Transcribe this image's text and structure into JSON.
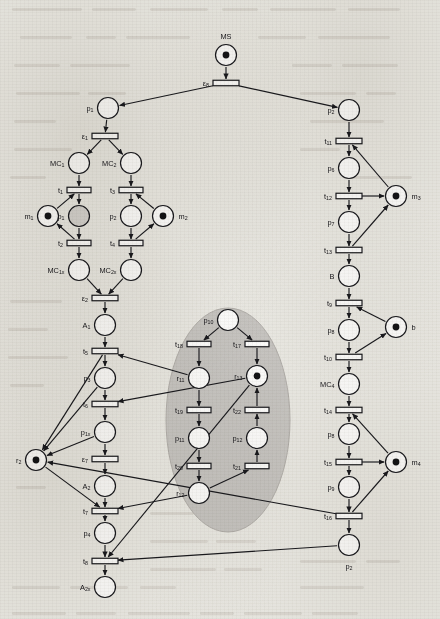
{
  "diagram": {
    "type": "petri-net",
    "title": "MS",
    "background_note": "scanned book page with faint text bleed-through",
    "highlight_region": {
      "name": "shaded-ellipse",
      "color": "#c9c7c4",
      "cx": 228,
      "cy": 420,
      "rx": 62,
      "ry": 112
    }
  },
  "places": [
    {
      "id": "MS",
      "label": "MS",
      "x": 226,
      "y": 55,
      "tokens": 1,
      "label_pos": "above",
      "fill": "#ffffff"
    },
    {
      "id": "p1",
      "label": "p",
      "sub": "1",
      "x": 108,
      "y": 108,
      "tokens": 0,
      "label_pos": "left",
      "fill": "#ffffff"
    },
    {
      "id": "p5",
      "label": "p",
      "sub": "2",
      "x": 349,
      "y": 110,
      "tokens": 0,
      "label_pos": "left",
      "fill": "#ffffff"
    },
    {
      "id": "MC1",
      "label": "MC",
      "sub": "1",
      "x": 79,
      "y": 163,
      "tokens": 0,
      "label_pos": "left",
      "fill": "#ffffff"
    },
    {
      "id": "MC2",
      "label": "MC",
      "sub": "2",
      "x": 131,
      "y": 163,
      "tokens": 0,
      "label_pos": "left",
      "fill": "#ffffff"
    },
    {
      "id": "m1",
      "label": "m",
      "sub": "1",
      "x": 48,
      "y": 216,
      "tokens": 1,
      "label_pos": "left",
      "fill": "#ffffff"
    },
    {
      "id": "pl1",
      "label": "p",
      "sub": "1",
      "x": 79,
      "y": 216,
      "tokens": 0,
      "label_pos": "left",
      "fill": "#d8d6d3"
    },
    {
      "id": "pl2",
      "label": "p",
      "sub": "2",
      "x": 131,
      "y": 216,
      "tokens": 0,
      "label_pos": "left",
      "fill": "#ffffff"
    },
    {
      "id": "m2",
      "label": "m",
      "sub": "2",
      "x": 163,
      "y": 216,
      "tokens": 1,
      "label_pos": "right",
      "fill": "#ffffff"
    },
    {
      "id": "MC1x",
      "label": "MC",
      "sub": "1x",
      "x": 79,
      "y": 270,
      "tokens": 0,
      "label_pos": "left",
      "fill": "#ffffff"
    },
    {
      "id": "MC2x",
      "label": "MC",
      "sub": "2x",
      "x": 131,
      "y": 270,
      "tokens": 0,
      "label_pos": "left",
      "fill": "#ffffff"
    },
    {
      "id": "A1",
      "label": "A",
      "sub": "1",
      "x": 105,
      "y": 325,
      "tokens": 0,
      "label_pos": "left",
      "fill": "#ffffff"
    },
    {
      "id": "p3",
      "label": "p",
      "sub": "3",
      "x": 105,
      "y": 378,
      "tokens": 0,
      "label_pos": "left",
      "fill": "#ffffff"
    },
    {
      "id": "p1x",
      "label": "p",
      "sub": "1x",
      "x": 105,
      "y": 432,
      "tokens": 0,
      "label_pos": "left",
      "fill": "#ffffff"
    },
    {
      "id": "r2",
      "label": "r",
      "sub": "2",
      "x": 36,
      "y": 460,
      "tokens": 1,
      "label_pos": "left",
      "fill": "#ffffff"
    },
    {
      "id": "A2",
      "label": "A",
      "sub": "2",
      "x": 105,
      "y": 486,
      "tokens": 0,
      "label_pos": "left",
      "fill": "#ffffff"
    },
    {
      "id": "p4",
      "label": "p",
      "sub": "4",
      "x": 105,
      "y": 533,
      "tokens": 0,
      "label_pos": "left",
      "fill": "#ffffff"
    },
    {
      "id": "A2x",
      "label": "A",
      "sub": "2x",
      "x": 105,
      "y": 587,
      "tokens": 0,
      "label_pos": "left",
      "fill": "#ffffff"
    },
    {
      "id": "p10",
      "label": "p",
      "sub": "10",
      "x": 228,
      "y": 320,
      "tokens": 0,
      "label_pos": "left",
      "fill": "#ffffff"
    },
    {
      "id": "r11",
      "label": "r",
      "sub": "11",
      "x": 199,
      "y": 378,
      "tokens": 0,
      "label_pos": "left",
      "fill": "#ffffff"
    },
    {
      "id": "r13",
      "label": "r",
      "sub": "13",
      "x": 257,
      "y": 376,
      "tokens": 1,
      "label_pos": "left",
      "fill": "#ffffff"
    },
    {
      "id": "p11",
      "label": "p",
      "sub": "11",
      "x": 199,
      "y": 438,
      "tokens": 0,
      "label_pos": "left",
      "fill": "#ffffff"
    },
    {
      "id": "p12",
      "label": "p",
      "sub": "12",
      "x": 257,
      "y": 438,
      "tokens": 0,
      "label_pos": "left",
      "fill": "#ffffff"
    },
    {
      "id": "r12",
      "label": "r",
      "sub": "12",
      "x": 199,
      "y": 493,
      "tokens": 0,
      "label_pos": "left",
      "fill": "#ffffff"
    },
    {
      "id": "p6",
      "label": "p",
      "sub": "6",
      "x": 349,
      "y": 168,
      "tokens": 0,
      "label_pos": "left",
      "fill": "#ffffff"
    },
    {
      "id": "m3",
      "label": "m",
      "sub": "3",
      "x": 396,
      "y": 196,
      "tokens": 1,
      "label_pos": "right",
      "fill": "#ffffff"
    },
    {
      "id": "p7",
      "label": "p",
      "sub": "7",
      "x": 349,
      "y": 222,
      "tokens": 0,
      "label_pos": "left",
      "fill": "#ffffff"
    },
    {
      "id": "B",
      "label": "B",
      "x": 349,
      "y": 276,
      "tokens": 0,
      "label_pos": "left",
      "fill": "#ffffff"
    },
    {
      "id": "p8",
      "label": "p",
      "sub": "8",
      "x": 349,
      "y": 330,
      "tokens": 0,
      "label_pos": "left",
      "fill": "#ffffff"
    },
    {
      "id": "b",
      "label": "b",
      "x": 396,
      "y": 327,
      "tokens": 1,
      "label_pos": "right",
      "fill": "#ffffff"
    },
    {
      "id": "MC4",
      "label": "MC",
      "sub": "4",
      "x": 349,
      "y": 384,
      "tokens": 0,
      "label_pos": "left",
      "fill": "#ffffff"
    },
    {
      "id": "p8b",
      "label": "p",
      "sub": "8",
      "x": 349,
      "y": 434,
      "tokens": 0,
      "label_pos": "left",
      "fill": "#ffffff"
    },
    {
      "id": "m4",
      "label": "m",
      "sub": "4",
      "x": 396,
      "y": 462,
      "tokens": 1,
      "label_pos": "right",
      "fill": "#ffffff"
    },
    {
      "id": "p9",
      "label": "p",
      "sub": "9",
      "x": 349,
      "y": 487,
      "tokens": 0,
      "label_pos": "left",
      "fill": "#ffffff"
    },
    {
      "id": "p2",
      "label": "p",
      "sub": "2",
      "x": 349,
      "y": 545,
      "tokens": 0,
      "label_pos": "below",
      "fill": "#ffffff"
    }
  ],
  "transitions": [
    {
      "id": "e8",
      "label": "ε",
      "sub": "8",
      "x": 226,
      "y": 83,
      "w": 26,
      "label_pos": "left"
    },
    {
      "id": "e1",
      "label": "ε",
      "sub": "1",
      "x": 105,
      "y": 136,
      "w": 26,
      "label_pos": "left"
    },
    {
      "id": "t1",
      "label": "t",
      "sub": "1",
      "x": 79,
      "y": 190,
      "w": 24,
      "label_pos": "left"
    },
    {
      "id": "t3",
      "label": "t",
      "sub": "3",
      "x": 131,
      "y": 190,
      "w": 24,
      "label_pos": "left"
    },
    {
      "id": "t2",
      "label": "t",
      "sub": "2",
      "x": 79,
      "y": 243,
      "w": 24,
      "label_pos": "left"
    },
    {
      "id": "t4",
      "label": "t",
      "sub": "4",
      "x": 131,
      "y": 243,
      "w": 24,
      "label_pos": "left"
    },
    {
      "id": "e2",
      "label": "ε",
      "sub": "2",
      "x": 105,
      "y": 298,
      "w": 26,
      "label_pos": "left"
    },
    {
      "id": "t5",
      "label": "t",
      "sub": "5",
      "x": 105,
      "y": 351,
      "w": 26,
      "label_pos": "left"
    },
    {
      "id": "t6",
      "label": "t",
      "sub": "6",
      "x": 105,
      "y": 404,
      "w": 26,
      "label_pos": "left"
    },
    {
      "id": "e7",
      "label": "ε",
      "sub": "7",
      "x": 105,
      "y": 459,
      "w": 26,
      "label_pos": "left"
    },
    {
      "id": "t7",
      "label": "t",
      "sub": "7",
      "x": 105,
      "y": 511,
      "w": 26,
      "label_pos": "left"
    },
    {
      "id": "t8",
      "label": "t",
      "sub": "8",
      "x": 105,
      "y": 561,
      "w": 26,
      "label_pos": "left"
    },
    {
      "id": "t18",
      "label": "t",
      "sub": "18",
      "x": 199,
      "y": 344,
      "w": 24,
      "label_pos": "left"
    },
    {
      "id": "t17",
      "label": "t",
      "sub": "17",
      "x": 257,
      "y": 344,
      "w": 24,
      "label_pos": "left"
    },
    {
      "id": "t19",
      "label": "t",
      "sub": "19",
      "x": 199,
      "y": 410,
      "w": 24,
      "label_pos": "left"
    },
    {
      "id": "t22",
      "label": "t",
      "sub": "22",
      "x": 257,
      "y": 410,
      "w": 24,
      "label_pos": "left"
    },
    {
      "id": "t20",
      "label": "t",
      "sub": "20",
      "x": 199,
      "y": 466,
      "w": 24,
      "label_pos": "left"
    },
    {
      "id": "t21",
      "label": "t",
      "sub": "21",
      "x": 257,
      "y": 466,
      "w": 24,
      "label_pos": "left"
    },
    {
      "id": "t11",
      "label": "t",
      "sub": "11",
      "x": 349,
      "y": 141,
      "w": 26,
      "label_pos": "left"
    },
    {
      "id": "t12",
      "label": "t",
      "sub": "12",
      "x": 349,
      "y": 196,
      "w": 26,
      "label_pos": "left"
    },
    {
      "id": "t13",
      "label": "t",
      "sub": "13",
      "x": 349,
      "y": 250,
      "w": 26,
      "label_pos": "left"
    },
    {
      "id": "t9",
      "label": "t",
      "sub": "9",
      "x": 349,
      "y": 303,
      "w": 26,
      "label_pos": "left"
    },
    {
      "id": "t10",
      "label": "t",
      "sub": "10",
      "x": 349,
      "y": 357,
      "w": 26,
      "label_pos": "left"
    },
    {
      "id": "t14",
      "label": "t",
      "sub": "14",
      "x": 349,
      "y": 410,
      "w": 26,
      "label_pos": "left"
    },
    {
      "id": "t15",
      "label": "t",
      "sub": "15",
      "x": 349,
      "y": 462,
      "w": 26,
      "label_pos": "left"
    },
    {
      "id": "t16",
      "label": "t",
      "sub": "16",
      "x": 349,
      "y": 516,
      "w": 26,
      "label_pos": "left"
    }
  ],
  "arcs": [
    [
      "MS",
      "e8"
    ],
    [
      "e8",
      "p1"
    ],
    [
      "e8",
      "p5"
    ],
    [
      "p1",
      "e1"
    ],
    [
      "e1",
      "MC1"
    ],
    [
      "e1",
      "MC2"
    ],
    [
      "MC1",
      "t1"
    ],
    [
      "MC2",
      "t3"
    ],
    [
      "m1",
      "t1"
    ],
    [
      "t1",
      "pl1"
    ],
    [
      "m2",
      "t3"
    ],
    [
      "t3",
      "pl2"
    ],
    [
      "pl1",
      "t2"
    ],
    [
      "pl2",
      "t4"
    ],
    [
      "t2",
      "m1"
    ],
    [
      "t4",
      "m2"
    ],
    [
      "t2",
      "MC1x"
    ],
    [
      "t4",
      "MC2x"
    ],
    [
      "MC1x",
      "e2"
    ],
    [
      "MC2x",
      "e2"
    ],
    [
      "e2",
      "A1"
    ],
    [
      "A1",
      "t5"
    ],
    [
      "t5",
      "p3"
    ],
    [
      "p3",
      "t6"
    ],
    [
      "t6",
      "p1x"
    ],
    [
      "p1x",
      "e7"
    ],
    [
      "e7",
      "A2"
    ],
    [
      "A2",
      "t7"
    ],
    [
      "t7",
      "p4"
    ],
    [
      "p4",
      "t8"
    ],
    [
      "t8",
      "A2x"
    ],
    [
      "p3",
      "r2"
    ],
    [
      "p1x",
      "r2"
    ],
    [
      "r2",
      "t7"
    ],
    [
      "t5",
      "r2"
    ],
    [
      "p10",
      "t18"
    ],
    [
      "p10",
      "t17"
    ],
    [
      "t18",
      "r11"
    ],
    [
      "t17",
      "r13"
    ],
    [
      "r11",
      "t19"
    ],
    [
      "t19",
      "p11"
    ],
    [
      "p11",
      "t20"
    ],
    [
      "t20",
      "r12"
    ],
    [
      "p12",
      "t22"
    ],
    [
      "t22",
      "r13"
    ],
    [
      "t21",
      "p12"
    ],
    [
      "r12",
      "t21"
    ],
    [
      "r11",
      "t5"
    ],
    [
      "r13",
      "t6"
    ],
    [
      "r12",
      "t7"
    ],
    [
      "r13",
      "t8"
    ],
    [
      "p5",
      "t11"
    ],
    [
      "t11",
      "p6"
    ],
    [
      "p6",
      "t12"
    ],
    [
      "t12",
      "p7"
    ],
    [
      "p7",
      "t13"
    ],
    [
      "m3",
      "t11"
    ],
    [
      "t12",
      "m3"
    ],
    [
      "t13",
      "m3"
    ],
    [
      "t13",
      "B"
    ],
    [
      "B",
      "t9"
    ],
    [
      "t9",
      "p8"
    ],
    [
      "p8",
      "t10"
    ],
    [
      "t10",
      "MC4"
    ],
    [
      "b",
      "t9"
    ],
    [
      "t10",
      "b"
    ],
    [
      "MC4",
      "t14"
    ],
    [
      "t14",
      "p8b"
    ],
    [
      "p8b",
      "t15"
    ],
    [
      "t15",
      "p9"
    ],
    [
      "p9",
      "t16"
    ],
    [
      "t16",
      "p2"
    ],
    [
      "m4",
      "t14"
    ],
    [
      "t15",
      "m4"
    ],
    [
      "t16",
      "m4"
    ],
    [
      "p2",
      "t8"
    ],
    [
      "t16",
      "r2"
    ]
  ],
  "colors": {
    "stroke": "#1a1a1e",
    "place_fill": "#ffffff",
    "place_fill_shaded": "#d8d6d3",
    "transition_fill": "#ffffff",
    "ellipse_fill": "#c9c7c4",
    "paper": "#edece7"
  }
}
